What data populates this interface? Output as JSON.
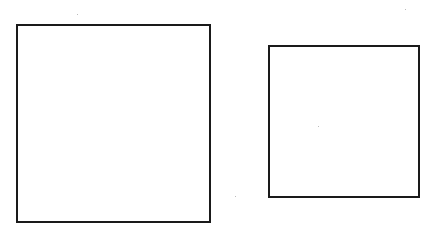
{
  "diagram": {
    "background": "#ffffff",
    "stroke_color": "#1a1a1a",
    "shapes": [
      {
        "type": "square",
        "label": "large",
        "x": 16,
        "y": 24,
        "width": 195,
        "height": 199
      },
      {
        "type": "square",
        "label": "small",
        "x": 268,
        "y": 45,
        "width": 152,
        "height": 153
      }
    ]
  }
}
